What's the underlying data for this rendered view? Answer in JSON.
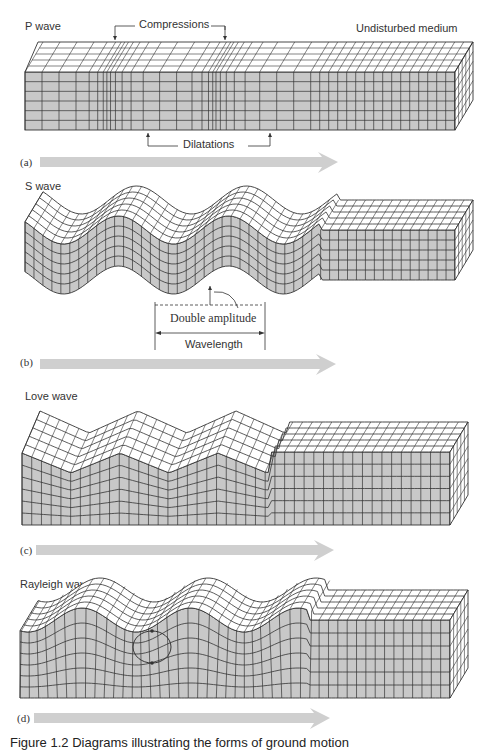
{
  "figure": {
    "caption": "Figure 1.2 Diagrams illustrating the forms of ground motion",
    "colors": {
      "front_face": "#c8c8c8",
      "top_face": "#ffffff",
      "grid_line": "#333333",
      "arrow": "#cfcfcf"
    },
    "panels": [
      {
        "id": "a",
        "letter": "(a)",
        "title": "P wave",
        "labels": {
          "top": "Compressions",
          "bottom": "Dilatations",
          "right": "Undisturbed medium"
        }
      },
      {
        "id": "b",
        "letter": "(b)",
        "title": "S wave",
        "labels": {
          "amplitude": "Double amplitude",
          "wavelength": "Wavelength"
        }
      },
      {
        "id": "c",
        "letter": "(c)",
        "title": "Love wave"
      },
      {
        "id": "d",
        "letter": "(d)",
        "title": "Rayleigh wave"
      }
    ]
  }
}
